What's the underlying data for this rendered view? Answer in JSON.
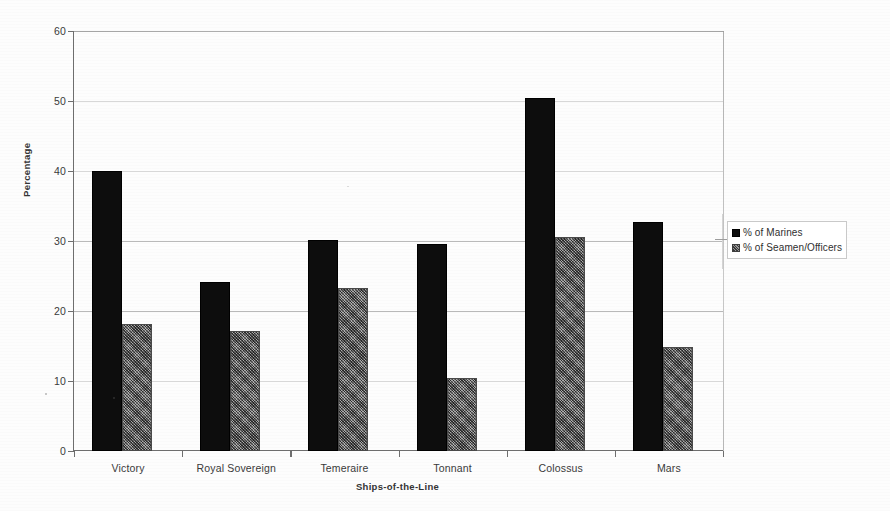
{
  "chart_data": {
    "type": "bar",
    "title": "",
    "xlabel": "Ships-of-the-Line",
    "ylabel": "Percentage",
    "ylim": [
      0,
      60
    ],
    "yticks": [
      0,
      10,
      20,
      30,
      40,
      50,
      60
    ],
    "grid": true,
    "legend_position": "right",
    "categories": [
      "Victory",
      "Royal Sovereign",
      "Temeraire",
      "Tonnant",
      "Colossus",
      "Mars"
    ],
    "series": [
      {
        "name": "% of Marines",
        "color": "#0d0d0d",
        "values": [
          40.0,
          24.1,
          30.2,
          29.6,
          50.4,
          32.7
        ]
      },
      {
        "name": "% of Seamen/Officers",
        "color": "#8d8d8d",
        "values": [
          18.1,
          17.1,
          23.3,
          10.5,
          30.6,
          14.8
        ]
      }
    ]
  },
  "axes": {
    "y_title": "Percentage",
    "x_title": "Ships-of-the-Line",
    "y_tick_labels": [
      "60",
      "50",
      "40",
      "30",
      "20",
      "10",
      "0"
    ]
  },
  "legend": {
    "items": [
      {
        "label": "% of Marines",
        "swatch": "black-square-icon"
      },
      {
        "label": "% of Seamen/Officers",
        "swatch": "gray-square-icon"
      }
    ]
  }
}
